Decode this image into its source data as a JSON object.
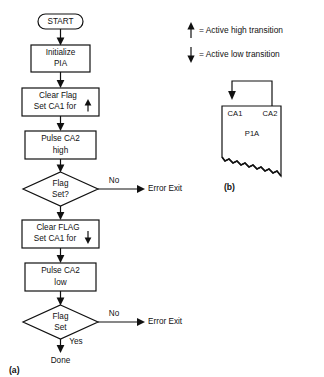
{
  "figure": {
    "panel_a": {
      "label": "(a)",
      "nodes": [
        {
          "id": "start",
          "type": "terminator",
          "lines": [
            "START"
          ]
        },
        {
          "id": "init",
          "type": "process",
          "lines": [
            "Initialize",
            "PIA"
          ]
        },
        {
          "id": "clearflag1",
          "type": "process",
          "lines": [
            "Clear Flag",
            "Set CA1 for"
          ],
          "trailing_icon": "up-arrow-icon"
        },
        {
          "id": "pulsehigh",
          "type": "process",
          "lines": [
            "Pulse CA2",
            "high"
          ]
        },
        {
          "id": "flagset1",
          "type": "decision",
          "lines": [
            "Flag",
            "Set?"
          ]
        },
        {
          "id": "clearflag2",
          "type": "process",
          "lines": [
            "Clear FLAG",
            "Set CA1 for"
          ],
          "trailing_icon": "down-arrow-icon"
        },
        {
          "id": "pulselow",
          "type": "process",
          "lines": [
            "Pulse CA2",
            "low"
          ]
        },
        {
          "id": "flagset2",
          "type": "decision",
          "lines": [
            "Flag",
            "Set"
          ]
        },
        {
          "id": "done",
          "type": "endpoint",
          "lines": [
            "Done"
          ]
        }
      ],
      "edge_labels": {
        "no_1": "No",
        "no_2": "No",
        "yes": "Yes"
      },
      "exits": {
        "error_exit_1": "Error Exit",
        "error_exit_2": "Error Exit"
      }
    },
    "panel_b": {
      "label": "(b)",
      "chip_label": "P1A",
      "pin_left": "CA1",
      "pin_right": "CA2"
    },
    "legend": {
      "items": [
        {
          "icon": "up-arrow-icon",
          "text": "= Active high transition"
        },
        {
          "icon": "down-arrow-icon",
          "text": "= Active low transition"
        }
      ]
    },
    "colors": {
      "ink": "#111111",
      "paper": "#ffffff"
    }
  }
}
